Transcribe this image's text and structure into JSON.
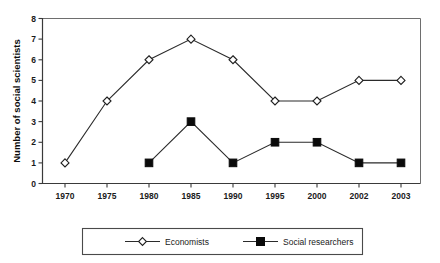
{
  "chart_data": {
    "type": "line",
    "title": "",
    "xlabel": "",
    "ylabel": "Number of social scientists",
    "categories": [
      "1970",
      "1975",
      "1980",
      "1985",
      "1990",
      "1995",
      "2000",
      "2002",
      "2003"
    ],
    "ylim": [
      0,
      8
    ],
    "yticks": [
      "0",
      "1",
      "2",
      "3",
      "4",
      "5",
      "6",
      "7",
      "8"
    ],
    "grid": false,
    "legend_position": "bottom",
    "series": [
      {
        "name": "Economists",
        "marker": "open-diamond",
        "color": "#1f1f1f",
        "values": [
          1,
          4,
          6,
          7,
          6,
          4,
          4,
          5,
          5
        ]
      },
      {
        "name": "Social researchers",
        "marker": "filled-square",
        "color": "#0a0a0a",
        "values": [
          null,
          null,
          1,
          3,
          1,
          2,
          2,
          1,
          1
        ]
      }
    ]
  },
  "legend": {
    "entries": [
      {
        "label": "Economists"
      },
      {
        "label": "Social researchers"
      }
    ]
  }
}
